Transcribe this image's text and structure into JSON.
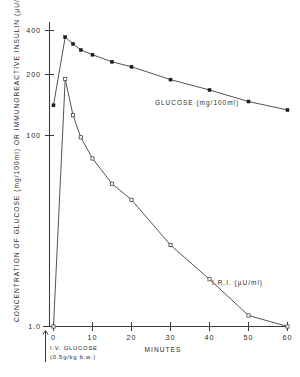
{
  "chart_data": {
    "type": "line",
    "title": "",
    "xlabel": "MINUTES",
    "ylabel": "CONCENTRATION OF GLUCOSE (mg/100ml) OR IMMUNOREACTIVE INSULIN (µU/ml)",
    "yscale": "log",
    "ylim": [
      1.0,
      500
    ],
    "xlim": [
      -3,
      60
    ],
    "grid": false,
    "legend_position": "inline-annotations",
    "x_ticks": [
      0,
      10,
      20,
      30,
      40,
      50,
      60
    ],
    "x_tick_labels": [
      "0",
      "10",
      "20",
      "30",
      "40",
      "50",
      "60"
    ],
    "y_ticks": [
      1.0,
      100,
      200,
      400
    ],
    "y_tick_labels": [
      "1.0",
      "100",
      "200",
      "400"
    ],
    "x": [
      0,
      3,
      5,
      7,
      10,
      15,
      20,
      30,
      40,
      50,
      60
    ],
    "series": [
      {
        "name": "GLUCOSE (mg/100ml)",
        "marker": "filled-square",
        "units": "mg/100ml",
        "values": [
          88,
          350,
          305,
          270,
          245,
          212,
          192,
          148,
          120,
          95,
          80
        ]
      },
      {
        "name": "I.R.I. (µU/ml)",
        "marker": "open-square",
        "units": "µU/ml",
        "values": [
          1.0,
          150,
          72,
          46,
          30,
          18,
          13,
          5.2,
          2.6,
          1.25,
          1.0
        ]
      }
    ],
    "annotations": [
      {
        "name": "glucose-series-label",
        "text": "GLUCOSE (mg/100ml)"
      },
      {
        "name": "iri-series-label",
        "text": "I.R.I. (µU/ml)"
      },
      {
        "name": "injection-label-line1",
        "text": "I.V. GLUCOSE"
      },
      {
        "name": "injection-label-line2",
        "text": "(0.5g/kg b.w.)"
      }
    ],
    "colors": {
      "axis": "#3a3a3a",
      "curve": "#4a4a4a",
      "filled_marker": "#1d1d1d",
      "open_marker": "#ffffff",
      "background": "#ffffff"
    }
  },
  "axes": {
    "y_title": "CONCENTRATION OF GLUCOSE (mg/100ml) OR IMMUNOREACTIVE INSULIN (µU/ml)",
    "x_title": "MINUTES",
    "y_tick_400": "400",
    "y_tick_200": "200",
    "y_tick_100": "100",
    "y_tick_1": "1.0",
    "x_tick_0": "0",
    "x_tick_10": "10",
    "x_tick_20": "20",
    "x_tick_30": "30",
    "x_tick_40": "40",
    "x_tick_50": "50",
    "x_tick_60": "60"
  },
  "labels": {
    "glucose": "GLUCOSE (mg/100ml)",
    "iri": "I.R.I. (µU/ml)",
    "injection_line1": "I.V. GLUCOSE",
    "injection_line2": "(0.5g/kg b.w.)"
  }
}
